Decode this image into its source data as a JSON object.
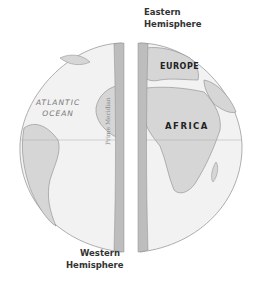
{
  "labels": {
    "eastern": "Eastern\nHemisphere",
    "eastern_line1": "Eastern",
    "eastern_line2": "Hemisphere",
    "western_line1": "Western",
    "western_line2": "Hemisphere",
    "europe": "EUROPE",
    "africa": "AFRICA",
    "atlantic_line1": "ATLANTIC",
    "atlantic_line2": "OCEAN",
    "prime_meridian": "Prime Meridian"
  },
  "colors": {
    "ocean": "#f2f2f2",
    "land": "#d6d6d6",
    "outline": "#9a9a9a",
    "cut_face": "#bdbdbd",
    "text_dark": "#333333"
  }
}
